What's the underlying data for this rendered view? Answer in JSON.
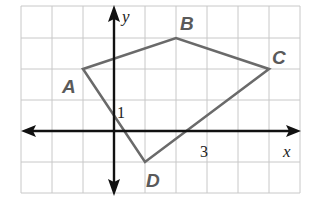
{
  "diagram": {
    "type": "coordinate-plane-quadrilateral",
    "axes": {
      "x_label": "x",
      "y_label": "y"
    },
    "tick_labels": {
      "x": "3",
      "y": "1"
    },
    "grid": {
      "x_range": [
        -3,
        6
      ],
      "y_range": [
        -2,
        4
      ],
      "cell_px": 31
    },
    "vertices": [
      {
        "label": "A",
        "x": -1,
        "y": 2
      },
      {
        "label": "B",
        "x": 2,
        "y": 3
      },
      {
        "label": "C",
        "x": 5,
        "y": 2
      },
      {
        "label": "D",
        "x": 1,
        "y": -1
      }
    ],
    "colors": {
      "polygon": "#6a6a6a",
      "axes": "#111111",
      "grid": "#c8c8c8",
      "vertex_labels": "#5a5a5a"
    }
  }
}
